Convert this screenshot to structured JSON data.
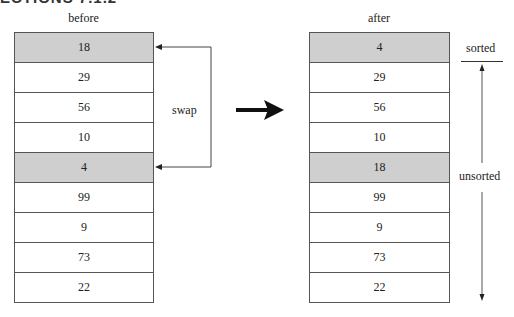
{
  "header": {
    "cropped_title": "ECTIONS 7.1.2"
  },
  "before": {
    "label": "before",
    "rows": [
      {
        "value": "18",
        "highlight": true
      },
      {
        "value": "29",
        "highlight": false
      },
      {
        "value": "56",
        "highlight": false
      },
      {
        "value": "10",
        "highlight": false
      },
      {
        "value": "4",
        "highlight": true
      },
      {
        "value": "99",
        "highlight": false
      },
      {
        "value": "9",
        "highlight": false
      },
      {
        "value": "73",
        "highlight": false
      },
      {
        "value": "22",
        "highlight": false
      }
    ]
  },
  "after": {
    "label": "after",
    "rows": [
      {
        "value": "4",
        "highlight": true
      },
      {
        "value": "29",
        "highlight": false
      },
      {
        "value": "56",
        "highlight": false
      },
      {
        "value": "10",
        "highlight": false
      },
      {
        "value": "18",
        "highlight": true
      },
      {
        "value": "99",
        "highlight": false
      },
      {
        "value": "9",
        "highlight": false
      },
      {
        "value": "73",
        "highlight": false
      },
      {
        "value": "22",
        "highlight": false
      }
    ]
  },
  "annotations": {
    "swap": "swap",
    "sorted": "sorted",
    "unsorted": "unsorted"
  },
  "colors": {
    "highlight": "#cfcfcf",
    "line": "#555555",
    "arrow": "#111111"
  }
}
